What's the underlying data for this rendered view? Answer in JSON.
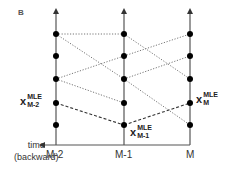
{
  "panel_label": "B",
  "axis": {
    "time_label_line1": "time",
    "time_label_line2": "(backward)",
    "ticks": [
      "M-2",
      "M-1",
      "M"
    ]
  },
  "annotations": {
    "m2": {
      "base": "x",
      "sup": "MLE",
      "sub": "M-2"
    },
    "m1": {
      "base": "x",
      "sup": "MLE",
      "sub": "M-1"
    },
    "m": {
      "base": "x",
      "sup": "MLE",
      "sub": "M"
    }
  },
  "colors": {
    "axis": "#555555",
    "node": "#000000",
    "dotted": "#777777",
    "dashed": "#333333"
  },
  "structure": {
    "columns_x": [
      56,
      124,
      190
    ],
    "node_y": [
      34,
      56,
      79,
      103,
      125
    ],
    "dotted_edges": [
      [
        0,
        0,
        1,
        0
      ],
      [
        0,
        0,
        1,
        2
      ],
      [
        0,
        2,
        1,
        1
      ],
      [
        0,
        2,
        1,
        3
      ],
      [
        1,
        0,
        2,
        2
      ],
      [
        1,
        1,
        2,
        0
      ],
      [
        1,
        2,
        2,
        1
      ],
      [
        1,
        2,
        2,
        4
      ]
    ],
    "mle_path": [
      [
        0,
        3
      ],
      [
        1,
        4
      ],
      [
        2,
        3
      ]
    ]
  }
}
